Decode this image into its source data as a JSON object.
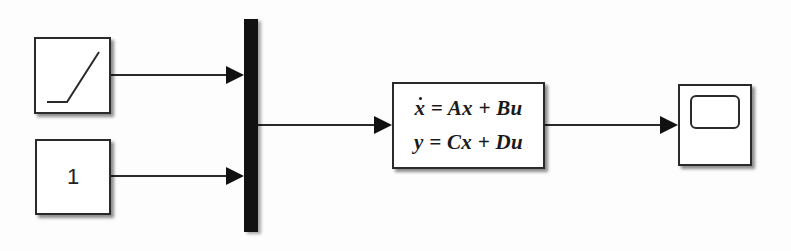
{
  "diagram": {
    "type": "simulink-block-diagram",
    "blocks": {
      "ramp": {
        "name": "Ramp",
        "icon": "ramp-icon"
      },
      "constant": {
        "name": "Constant",
        "value": "1"
      },
      "mux": {
        "name": "Mux",
        "inputs": 2
      },
      "state_space": {
        "name": "State-Space",
        "equation_1": "x = Ax + Bu",
        "equation_1_lhs": "x",
        "equation_1_rhs": " = Ax + Bu",
        "equation_2": "y = Cx + Du"
      },
      "scope": {
        "name": "Scope",
        "icon": "scope-icon"
      }
    },
    "connections": [
      {
        "from": "Ramp",
        "to": "Mux:1"
      },
      {
        "from": "Constant",
        "to": "Mux:2"
      },
      {
        "from": "Mux",
        "to": "State-Space"
      },
      {
        "from": "State-Space",
        "to": "Scope"
      }
    ],
    "colors": {
      "line": "#2a2a2a",
      "mux_fill": "#111111",
      "background": "#fdfdfd"
    }
  }
}
